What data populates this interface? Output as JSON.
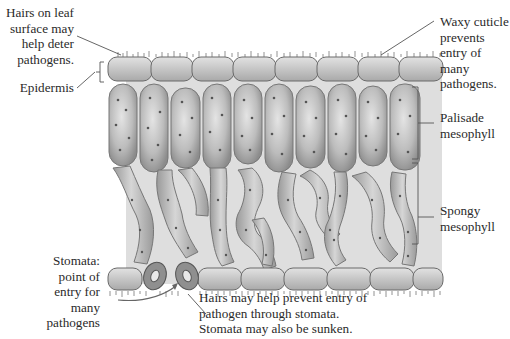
{
  "diagram": {
    "type": "leaf-cross-section",
    "colors": {
      "background_tissue": "#dcdcdc",
      "cell_fill": "#bdbdbd",
      "cell_stroke": "#6e6e6e",
      "epidermis_fill": "#c9c9c9",
      "guard_cell_fill": "#8f8f8f",
      "chloroplast": "#5a5a5a",
      "leader_line": "#555555",
      "text": "#2a2a2a"
    },
    "labels": {
      "hairs_surface": "Hairs on leaf\nsurface may\nhelp deter\npathogens.",
      "epidermis": "Epidermis",
      "waxy_cuticle": "Waxy cuticle\nprevents\nentry of\nmany\npathogens.",
      "palisade": "Palisade\nmesophyll",
      "spongy": "Spongy\nmesophyll",
      "stomata": "Stomata:\npoint of\nentry for\nmany\npathogens",
      "hairs_stomata": "Hairs may help prevent entry of\npathogen through stomata.\nStomata may also be sunken."
    },
    "structures": {
      "upper_epidermis_cells": 8,
      "palisade_cells": 8,
      "lower_epidermis_cells": 7,
      "stomata_guard_cells": 2
    }
  }
}
